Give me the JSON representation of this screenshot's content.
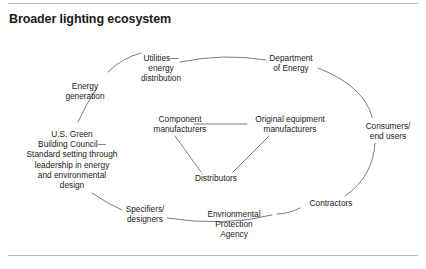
{
  "title": "Broader lighting ecosystem",
  "colors": {
    "text": "#1a1a1a",
    "rule": "#b9b9b9",
    "connector": "#5a5a5a",
    "background": "#ffffff"
  },
  "diagram": {
    "type": "ecosystem-ring",
    "ring_nodes": [
      {
        "id": "utilities",
        "label": "Utilities—\nenergy\ndistribution"
      },
      {
        "id": "doe",
        "label": "Department\nof Energy"
      },
      {
        "id": "consumers",
        "label": "Consumers/\nend users"
      },
      {
        "id": "contractors",
        "label": "Contractors"
      },
      {
        "id": "epa",
        "label": "Envrionmental\nProtection\nAgency"
      },
      {
        "id": "specifiers",
        "label": "Specifiers/\ndesigners"
      },
      {
        "id": "usgbc",
        "label": "U.S. Green\nBuilding Council—\nStandard setting through\nleadership in energy\nand environmental\ndesign"
      },
      {
        "id": "energy-gen",
        "label": "Energy\ngeneration"
      }
    ],
    "center_nodes": [
      {
        "id": "component-mfr",
        "label": "Component\nmanufacturers"
      },
      {
        "id": "oem",
        "label": "Original equipment\nmanufacturers"
      },
      {
        "id": "distributors",
        "label": "Distributors"
      }
    ],
    "connections": [
      {
        "from": "energy-gen",
        "to": "utilities"
      },
      {
        "from": "utilities",
        "to": "doe"
      },
      {
        "from": "doe",
        "to": "consumers"
      },
      {
        "from": "consumers",
        "to": "contractors"
      },
      {
        "from": "contractors",
        "to": "epa"
      },
      {
        "from": "epa",
        "to": "specifiers"
      },
      {
        "from": "specifiers",
        "to": "usgbc"
      },
      {
        "from": "usgbc",
        "to": "energy-gen"
      },
      {
        "from": "component-mfr",
        "to": "oem"
      },
      {
        "from": "component-mfr",
        "to": "distributors"
      },
      {
        "from": "oem",
        "to": "distributors"
      }
    ]
  }
}
